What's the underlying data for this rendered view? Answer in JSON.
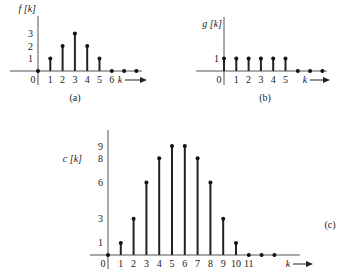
{
  "chart_data": [
    {
      "id": "a",
      "type": "stem",
      "caption": "(a)",
      "ylabel": "f [k]",
      "xlabel": "k",
      "x_ticks": [
        "0",
        "1",
        "2",
        "3",
        "4",
        "5",
        "6"
      ],
      "y_ticks": [
        "1",
        "2",
        "3"
      ],
      "k": [
        0,
        1,
        2,
        3,
        4,
        5,
        6,
        7,
        8
      ],
      "values": [
        0,
        1,
        2,
        3,
        2,
        1,
        0,
        0,
        0
      ]
    },
    {
      "id": "b",
      "type": "stem",
      "caption": "(b)",
      "ylabel": "g [k]",
      "xlabel": "k",
      "x_ticks": [
        "0",
        "1",
        "2",
        "3",
        "4",
        "5"
      ],
      "y_ticks": [
        "1"
      ],
      "k": [
        0,
        1,
        2,
        3,
        4,
        5,
        6,
        7,
        8
      ],
      "values": [
        1,
        1,
        1,
        1,
        1,
        1,
        0,
        0,
        0
      ]
    },
    {
      "id": "c",
      "type": "stem",
      "caption": "(c)",
      "ylabel": "c [k]",
      "xlabel": "k",
      "x_ticks": [
        "0",
        "1",
        "2",
        "3",
        "4",
        "5",
        "6",
        "7",
        "8",
        "9",
        "10",
        "11"
      ],
      "y_ticks": [
        "1",
        "3",
        "6",
        "8",
        "9"
      ],
      "k": [
        0,
        1,
        2,
        3,
        4,
        5,
        6,
        7,
        8,
        9,
        10,
        11,
        12,
        13
      ],
      "values": [
        0,
        1,
        3,
        6,
        8,
        9,
        9,
        8,
        6,
        3,
        1,
        0,
        0,
        0
      ]
    }
  ],
  "layout": [
    {
      "ox": 38,
      "oy": 71,
      "dx": 12.3,
      "dy": 12.5,
      "axisLeft": 10,
      "axisRight": 142,
      "axisTop": 16,
      "ylabelX": 36,
      "ylabelY": 12,
      "kX": 120,
      "arrowEnd": 147,
      "capX": 75,
      "capY": 101
    },
    {
      "ox": 224,
      "oy": 71,
      "dx": 12.3,
      "dy": 12.5,
      "axisLeft": 196,
      "axisRight": 327,
      "axisTop": 17,
      "ylabelX": 222,
      "ylabelY": 27,
      "kX": 305,
      "arrowEnd": 330,
      "capX": 265,
      "capY": 101
    },
    {
      "ox": 108,
      "oy": 255,
      "dx": 12.8,
      "dy": 12.1,
      "axisLeft": 90,
      "axisRight": 300,
      "axisTop": 130,
      "ylabelX": 82,
      "ylabelY": 162,
      "kX": 288,
      "arrowEnd": 313,
      "capX": 330,
      "capY": 228
    }
  ],
  "tick_positions": {
    "a": {
      "x_ticks_k": [
        0,
        1,
        2,
        3,
        4,
        5,
        6
      ]
    },
    "b": {
      "x_ticks_k": [
        0,
        1,
        2,
        3,
        4,
        5
      ]
    },
    "c": {
      "x_ticks_k": [
        0,
        1,
        2,
        3,
        4,
        5,
        6,
        7,
        8,
        9,
        10,
        11
      ]
    }
  }
}
